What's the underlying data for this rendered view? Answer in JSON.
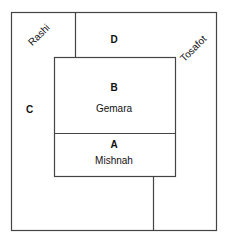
{
  "diagram": {
    "regions": {
      "A": {
        "letter": "A",
        "name": "Mishnah"
      },
      "B": {
        "letter": "B",
        "name": "Gemara"
      },
      "C": {
        "letter": "C"
      },
      "D": {
        "letter": "D"
      }
    },
    "margin_labels": {
      "left": "Rashi",
      "right": "Tosafot"
    },
    "line_color": "#444444"
  }
}
